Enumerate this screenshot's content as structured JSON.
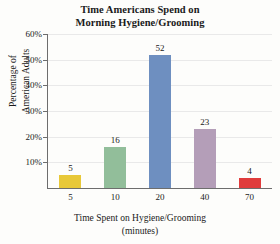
{
  "chart_data": {
    "type": "bar",
    "title": "Time Americans Spend on Morning Hygiene/Grooming",
    "title_line1": "Time Americans Spend on",
    "title_line2": "Morning Hygiene/Grooming",
    "xlabel": "Time Spent on Hygiene/Grooming (minutes)",
    "xlabel_line1": "Time Spent on Hygiene/Grooming",
    "xlabel_line2": "(minutes)",
    "ylabel": "Percentage of American Adults",
    "ylabel_line1": "Percentage of",
    "ylabel_line2": "American Adults",
    "categories": [
      "5",
      "10",
      "20",
      "40",
      "70"
    ],
    "values": [
      5,
      16,
      52,
      23,
      4
    ],
    "value_labels": [
      "5",
      "16",
      "52",
      "23",
      "4"
    ],
    "bar_colors": [
      "#E8C838",
      "#92BE9A",
      "#6E8FC0",
      "#B49EB8",
      "#E03C3C"
    ],
    "ylim": [
      0,
      60
    ],
    "ytick_values": [
      10,
      20,
      30,
      40,
      50,
      60
    ],
    "ytick_labels": [
      "10%",
      "20%",
      "30%",
      "40%",
      "50%",
      "60%"
    ],
    "grid": true,
    "legend": "none",
    "units": "percent"
  },
  "style": {
    "background": "#fdfdfb",
    "axis_color": "#6d6d6d",
    "grid_color": "#e9e9e9",
    "text_color": "#1a1a1a"
  }
}
